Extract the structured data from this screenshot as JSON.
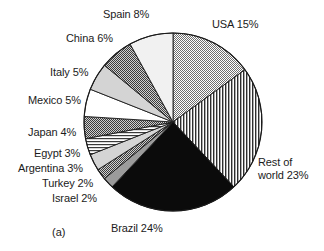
{
  "figure": {
    "caption": "(a)",
    "width": 324,
    "height": 251
  },
  "geometry": {
    "center_x": 173,
    "center_y": 122,
    "radius": 89,
    "start_angle_deg": -90,
    "direction": "clockwise"
  },
  "labels": [
    {
      "text": "Spain 8%",
      "x": 103,
      "y": 8,
      "align": "left",
      "wrap": false
    },
    {
      "text": "USA 15%",
      "x": 212,
      "y": 18,
      "align": "left",
      "wrap": false
    },
    {
      "text": "China 6%",
      "x": 66,
      "y": 32,
      "align": "left",
      "wrap": false
    },
    {
      "text": "Italy 5%",
      "x": 50,
      "y": 66,
      "align": "left",
      "wrap": false
    },
    {
      "text": "Mexico 5%",
      "x": 28,
      "y": 94,
      "align": "left",
      "wrap": false
    },
    {
      "text": "Japan 4%",
      "x": 28,
      "y": 126,
      "align": "left",
      "wrap": false
    },
    {
      "text": "Egypt 3%",
      "x": 34,
      "y": 147,
      "align": "left",
      "wrap": false
    },
    {
      "text": "Argentina 3%",
      "x": 18,
      "y": 162,
      "align": "left",
      "wrap": false
    },
    {
      "text": "Turkey 2%",
      "x": 42,
      "y": 177,
      "align": "left",
      "wrap": false
    },
    {
      "text": "Israel 2%",
      "x": 52,
      "y": 192,
      "align": "left",
      "wrap": false
    },
    {
      "text": "Rest of world 23%",
      "x": 258,
      "y": 156,
      "align": "left",
      "wrap": true
    },
    {
      "text": "Brazil 24%",
      "x": 111,
      "y": 222,
      "align": "left",
      "wrap": false
    }
  ],
  "chart_data": {
    "type": "pie",
    "title": "",
    "subtitle": "",
    "xlabel": "",
    "ylabel": "",
    "legend_position": "none",
    "annotations": [
      "(a)"
    ],
    "units": "percent",
    "total": 100,
    "start_angle_deg": -90,
    "direction": "clockwise",
    "categories": [
      "USA",
      "Rest of world",
      "Brazil",
      "Israel",
      "Turkey",
      "Argentina",
      "Egypt",
      "Japan",
      "Mexico",
      "Italy",
      "China",
      "Spain"
    ],
    "values": [
      15,
      23,
      24,
      2,
      2,
      3,
      3,
      4,
      5,
      5,
      6,
      8
    ],
    "labels": [
      "USA 15%",
      "Rest of world 23%",
      "Brazil 24%",
      "Israel 2%",
      "Turkey 2%",
      "Argentina 3%",
      "Egypt 3%",
      "Japan 4%",
      "Mexico 5%",
      "Italy 5%",
      "China 6%",
      "Spain 8%"
    ],
    "slices": [
      {
        "name": "USA",
        "value": 15,
        "label": "USA 15%",
        "fill": "checker-medium",
        "color": "#8d8d8d"
      },
      {
        "name": "Rest of world",
        "value": 23,
        "label": "Rest of world 23%",
        "fill": "vertical-lines",
        "color": "#707070"
      },
      {
        "name": "Brazil",
        "value": 24,
        "label": "Brazil 24%",
        "fill": "solid-black",
        "color": "#0a0a0a"
      },
      {
        "name": "Israel",
        "value": 2,
        "label": "Israel 2%",
        "fill": "solid-gray",
        "color": "#9b9b9b"
      },
      {
        "name": "Turkey",
        "value": 2,
        "label": "Turkey 2%",
        "fill": "checker-dark",
        "color": "#5e5e5e"
      },
      {
        "name": "Argentina",
        "value": 3,
        "label": "Argentina 3%",
        "fill": "solid-light",
        "color": "#d8d8d8"
      },
      {
        "name": "Egypt",
        "value": 3,
        "label": "Egypt 3%",
        "fill": "horizontal-lines",
        "color": "#8a8a8a"
      },
      {
        "name": "Japan",
        "value": 4,
        "label": "Japan 4%",
        "fill": "checker-dark",
        "color": "#4d4d4d"
      },
      {
        "name": "Mexico",
        "value": 5,
        "label": "Mexico 5%",
        "fill": "white",
        "color": "#ffffff"
      },
      {
        "name": "Italy",
        "value": 5,
        "label": "Italy 5%",
        "fill": "solid-light",
        "color": "#cfcfcf"
      },
      {
        "name": "China",
        "value": 6,
        "label": "China 6%",
        "fill": "checker-dark",
        "color": "#6a6a6a"
      },
      {
        "name": "Spain",
        "value": 8,
        "label": "Spain 8%",
        "fill": "near-white",
        "color": "#f0f0f0"
      }
    ]
  }
}
